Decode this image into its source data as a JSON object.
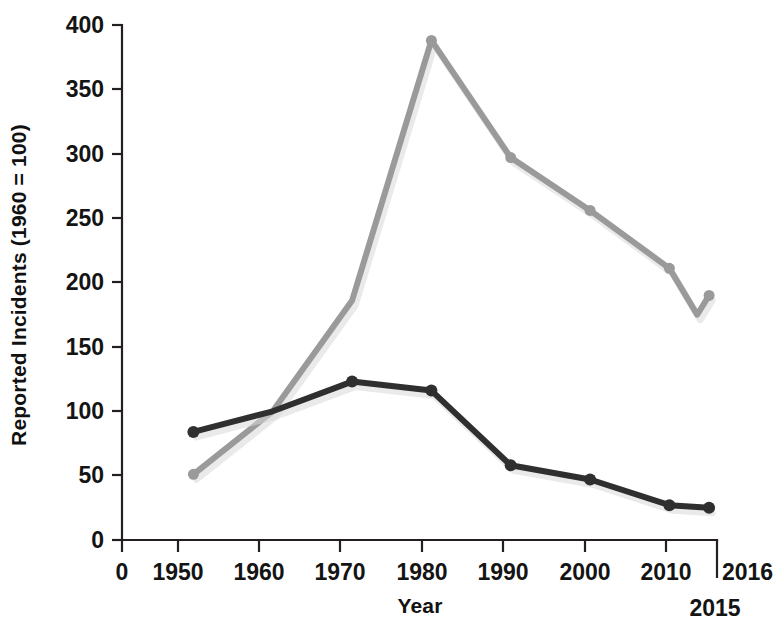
{
  "chart_data": {
    "type": "line",
    "title": "",
    "xlabel": "Year",
    "ylabel": "Reported Incidents (1960 = 100)",
    "xlim": [
      1941,
      2016
    ],
    "ylim": [
      0,
      400
    ],
    "grid": false,
    "legend": "none",
    "x_tick_labels": [
      "0",
      "1950",
      "1960",
      "1970",
      "1980",
      "1990",
      "2000",
      "2010",
      "2016"
    ],
    "x_tick_values": [
      1941,
      1950,
      1960,
      1970,
      1980,
      1990,
      2000,
      2010,
      2016
    ],
    "x_extra_label": "2015",
    "y_tick_labels": [
      "0",
      "50",
      "100",
      "150",
      "200",
      "250",
      "300",
      "350",
      "400"
    ],
    "y_tick_values": [
      0,
      50,
      100,
      150,
      200,
      250,
      300,
      350,
      400
    ],
    "categories": [
      1950,
      1960,
      1970,
      1980,
      1990,
      2000,
      2010,
      2015
    ],
    "series": [
      {
        "name": "gray-series",
        "color": "#9a9a9a",
        "x": [
          1950,
          1960,
          1970,
          1980,
          1990,
          2000,
          2010,
          2013.5,
          2015
        ],
        "values": [
          51,
          100,
          186,
          388,
          297,
          256,
          211,
          175,
          190
        ],
        "markers": [
          1950,
          1980,
          1990,
          2000,
          2010,
          2015
        ]
      },
      {
        "name": "dark-series",
        "color": "#2f2f2f",
        "x": [
          1950,
          1960,
          1970,
          1980,
          1990,
          2000,
          2010,
          2015
        ],
        "values": [
          84,
          100,
          123,
          116,
          58,
          47,
          27,
          25
        ],
        "markers": [
          1950,
          1970,
          1980,
          1990,
          2000,
          2010,
          2015
        ]
      }
    ]
  },
  "labels": {
    "y_axis_title": "Reported Incidents (1960 = 100)",
    "x_axis_title": "Year",
    "y_0": "0",
    "y_50": "50",
    "y_100": "100",
    "y_150": "150",
    "y_200": "200",
    "y_250": "250",
    "y_300": "300",
    "y_350": "350",
    "y_400": "400",
    "x_origin": "0",
    "x_1950": "1950",
    "x_1960": "1960",
    "x_1970": "1970",
    "x_1980": "1980",
    "x_1990": "1990",
    "x_2000": "2000",
    "x_2010": "2010",
    "x_2016": "2016",
    "x_2015": "2015"
  },
  "colors": {
    "dark_series": "#2f2f2f",
    "gray_series": "#9a9a9a",
    "axis": "#231f20",
    "background": "#ffffff"
  }
}
